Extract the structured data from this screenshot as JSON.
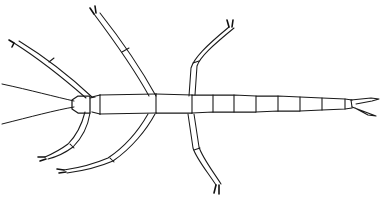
{
  "figure": {
    "style": "black ink line art on white background",
    "background_color": "#ffffff",
    "ink_color": "#1a1a1a",
    "width": 392,
    "height": 210,
    "orientation": "head at left, abdomen extending to right",
    "caption": ""
  },
  "anatomy": {
    "head": {
      "label": "head",
      "outline": "M 72 100 L 78 96 L 90 96 L 90 113 L 78 113 L 72 109 Z",
      "neck_line": "M 90 98 L 95 97"
    },
    "antennae": [
      {
        "label": "left-upper-antenna",
        "path": "M 74 101 C 56 97 30 90 2 84"
      },
      {
        "label": "left-lower-antenna",
        "path": "M 74 107 C 56 110 30 117 2 124"
      }
    ],
    "thorax": {
      "label": "thorax",
      "segments": [
        {
          "label": "prothorax",
          "top": "M 92 97 L 100 95",
          "bottom": "M 92 112 L 100 114"
        },
        {
          "label": "mesothorax",
          "top": "M 100 95 L 156 94",
          "bottom": "M 100 114 L 156 113"
        },
        {
          "label": "metathorax",
          "top": "M 156 94 L 192 95",
          "bottom": "M 156 113 L 192 113"
        }
      ],
      "joints": [
        {
          "label": "pro-meso-joint",
          "path": "M 100 95 L 100 114"
        },
        {
          "label": "meso-meta-joint",
          "path": "M 156 94 L 156 113"
        },
        {
          "label": "meta-abdomen-joint",
          "path": "M 192 95 L 192 113"
        }
      ]
    },
    "abdomen": {
      "label": "abdomen",
      "top_edge": "M 192 95 L 213 95 L 234 95 L 256 96 L 278 96 L 300 97 L 322 98 L 345 99 L 352 100",
      "bottom_edge": "M 192 113 L 213 112 L 234 112 L 256 112 L 278 111 L 300 111 L 322 110 L 345 109 L 352 108",
      "segment_joints": [
        {
          "label": "abdomen-joint-1",
          "path": "M 213 95 L 213 112"
        },
        {
          "label": "abdomen-joint-2",
          "path": "M 234 95 L 234 112"
        },
        {
          "label": "abdomen-joint-3",
          "path": "M 256 96 L 256 112"
        },
        {
          "label": "abdomen-joint-4",
          "path": "M 278 96 L 278 111"
        },
        {
          "label": "abdomen-joint-5",
          "path": "M 300 97 L 300 111"
        },
        {
          "label": "abdomen-joint-6",
          "path": "M 322 98 L 322 110"
        },
        {
          "label": "abdomen-joint-7",
          "path": "M 345 99 L 345 109"
        }
      ],
      "segment_count": 8
    },
    "cerci": {
      "label": "cerci",
      "upper_prong": "M 351 100 L 371 98 L 379 99 L 372 101 L 356 104",
      "lower_prong": "M 352 107 L 368 113 L 376 116 L 368 115 L 355 108",
      "base": "M 351 100 L 352 107"
    },
    "legs": [
      {
        "label": "front-left-leg",
        "side": "upper-left",
        "outer": "M 86 98 C 70 84 44 62 14 43",
        "inner": "M 92 97 C 76 82 50 60 19 41",
        "femur_tibia_joint": "M 49 62 L 54 58",
        "tarsus_tip": "M 14 43 L 9 40 M 14 43 L 12 47"
      },
      {
        "label": "mid-left-leg",
        "side": "upper-left-mid",
        "outer": "M 149 96 C 138 76 118 46 94 14",
        "inner": "M 156 96 C 145 76 126 46 100 13",
        "femur_tibia_joint": "M 122 52 L 129 48",
        "tarsus_tip": "M 94 14 L 90 8 M 96 13 L 95 6"
      },
      {
        "label": "hind-left-leg",
        "side": "upper-right-mid",
        "outer": "M 189 96 L 191 68 C 194 58 206 46 229 27",
        "inner": "M 195 95 L 197 66 C 200 57 212 46 234 28",
        "femur_tibia_joint": "M 193 63 L 199 61",
        "tarsus_tip": "M 229 27 L 227 20 M 232 27 L 233 20"
      },
      {
        "label": "front-right-leg",
        "side": "lower-left",
        "outer": "M 85 112 C 82 124 76 136 68 144 C 60 150 52 154 45 157",
        "inner": "M 90 113 C 88 126 82 138 73 147 C 65 153 56 157 48 159",
        "femur_tibia_joint": "M 70 144 L 74 148",
        "tarsus_tip": "M 45 157 L 38 157 M 46 159 L 40 161"
      },
      {
        "label": "mid-right-leg",
        "side": "lower-left-mid",
        "outer": "M 148 114 C 140 128 126 146 108 158 C 94 164 78 168 64 170",
        "inner": "M 155 114 C 147 129 132 148 113 161 C 99 167 82 171 67 173",
        "femur_tibia_joint": "M 110 158 L 114 162",
        "tarsus_tip": "M 64 170 L 57 169 M 66 172 L 59 173"
      },
      {
        "label": "hind-right-leg",
        "side": "lower-right-mid",
        "outer": "M 188 114 L 193 148 C 196 158 206 170 216 185",
        "inner": "M 194 114 L 199 147 C 202 157 212 170 221 184",
        "femur_tibia_joint": "M 194 150 L 200 148",
        "tarsus_tip": "M 216 185 L 214 193 M 219 185 L 219 194"
      }
    ]
  }
}
